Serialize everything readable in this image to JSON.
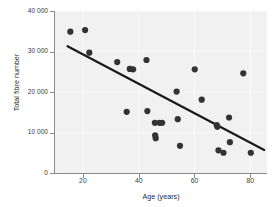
{
  "chart_data": {
    "type": "scatter",
    "title": "",
    "xlabel": "Age (years)",
    "ylabel": "Total fibre number",
    "xlim": [
      10,
      86
    ],
    "ylim": [
      0,
      40000
    ],
    "xticks": [
      20,
      40,
      60,
      80
    ],
    "xtick_labels": [
      "20",
      "40",
      "60",
      "80"
    ],
    "yticks": [
      0,
      10000,
      20000,
      30000,
      40000
    ],
    "ytick_labels": [
      "0",
      "10 000",
      "20 000",
      "30 000",
      "40 000"
    ],
    "grid": true,
    "grid_color": "#fafafa",
    "panel_color": "#f1f1f1",
    "point_color": "#333333",
    "point_size": 3.1,
    "legend": null,
    "series": [
      {
        "name": "Total fibre number vs age",
        "marker": "filled-circle",
        "points": [
          {
            "x": 15.5,
            "y": 34900
          },
          {
            "x": 20.8,
            "y": 35300
          },
          {
            "x": 22.3,
            "y": 29700
          },
          {
            "x": 32.3,
            "y": 27400
          },
          {
            "x": 35.7,
            "y": 15100
          },
          {
            "x": 36.8,
            "y": 25700
          },
          {
            "x": 38.0,
            "y": 25600
          },
          {
            "x": 42.8,
            "y": 27900
          },
          {
            "x": 43.1,
            "y": 15300
          },
          {
            "x": 45.8,
            "y": 12400
          },
          {
            "x": 45.9,
            "y": 9300
          },
          {
            "x": 46.1,
            "y": 8600
          },
          {
            "x": 47.5,
            "y": 12400
          },
          {
            "x": 48.4,
            "y": 12400
          },
          {
            "x": 53.6,
            "y": 20100
          },
          {
            "x": 54.0,
            "y": 13300
          },
          {
            "x": 54.8,
            "y": 6700
          },
          {
            "x": 60.1,
            "y": 25600
          },
          {
            "x": 62.6,
            "y": 18100
          },
          {
            "x": 68.0,
            "y": 11800
          },
          {
            "x": 68.2,
            "y": 11400
          },
          {
            "x": 68.6,
            "y": 5600
          },
          {
            "x": 70.4,
            "y": 5000
          },
          {
            "x": 72.4,
            "y": 13700
          },
          {
            "x": 72.7,
            "y": 7600
          },
          {
            "x": 77.5,
            "y": 24600
          },
          {
            "x": 80.2,
            "y": 5000
          }
        ]
      }
    ],
    "trendline": {
      "type": "linear-fit",
      "color": "#1a1a1a",
      "width": 2.2,
      "x_start": 14.5,
      "y_start": 31300,
      "x_end": 85.0,
      "y_end": 5700
    }
  }
}
